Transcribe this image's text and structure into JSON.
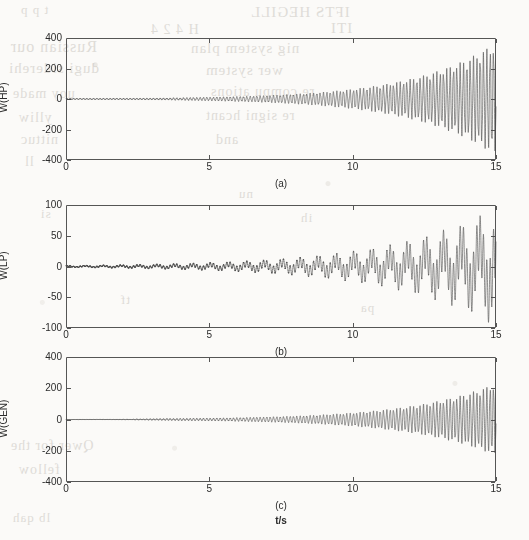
{
  "figure": {
    "background_color": "#fbfaf8",
    "ink_color": "#4a4a4a",
    "axis_color": "#555555",
    "xlabel": "t/s"
  },
  "bleed_through_text": [
    {
      "text": "t p p",
      "x": 20,
      "y": 2,
      "size": 13
    },
    {
      "text": "IFTS HEGILL",
      "x": 250,
      "y": 4,
      "size": 15
    },
    {
      "text": "H 4 2 4",
      "x": 150,
      "y": 22,
      "size": 14
    },
    {
      "text": "ITI",
      "x": 330,
      "y": 20,
      "size": 15
    },
    {
      "text": "Russian our",
      "x": 10,
      "y": 38,
      "size": 16
    },
    {
      "text": "nig system plan",
      "x": 190,
      "y": 40,
      "size": 15
    },
    {
      "text": "dugi siderehi",
      "x": 8,
      "y": 60,
      "size": 15
    },
    {
      "text": "wer system",
      "x": 205,
      "y": 62,
      "size": 15
    },
    {
      "text": "uoy made",
      "x": 12,
      "y": 86,
      "size": 14
    },
    {
      "text": "re compu ations",
      "x": 210,
      "y": 84,
      "size": 14
    },
    {
      "text": "ylliw",
      "x": 18,
      "y": 110,
      "size": 14
    },
    {
      "text": "re signi hcant",
      "x": 205,
      "y": 108,
      "size": 14
    },
    {
      "text": "nittuc",
      "x": 20,
      "y": 132,
      "size": 14
    },
    {
      "text": "and",
      "x": 215,
      "y": 132,
      "size": 14
    },
    {
      "text": "ll",
      "x": 24,
      "y": 154,
      "size": 14
    },
    {
      "text": "nu",
      "x": 238,
      "y": 186,
      "size": 13
    },
    {
      "text": "si",
      "x": 40,
      "y": 206,
      "size": 13
    },
    {
      "text": "ih",
      "x": 300,
      "y": 210,
      "size": 13
    },
    {
      "text": "tf",
      "x": 120,
      "y": 292,
      "size": 13
    },
    {
      "text": "pa",
      "x": 360,
      "y": 300,
      "size": 13
    },
    {
      "text": "Qwer for the",
      "x": 10,
      "y": 438,
      "size": 14
    },
    {
      "text": "fellow",
      "x": 18,
      "y": 462,
      "size": 14
    },
    {
      "text": "lb qah",
      "x": 12,
      "y": 510,
      "size": 13
    }
  ],
  "panels": [
    {
      "id": "panel-a",
      "caption": "(a)",
      "ylabel": "W(HP)",
      "box": {
        "left": 66,
        "top": 38,
        "width": 430,
        "height": 122
      },
      "caption_pos": {
        "x": 281,
        "y": 178
      },
      "chart_data": {
        "type": "line",
        "title": "",
        "xlabel": "",
        "ylabel": "W(HP)",
        "xlim": [
          0,
          15
        ],
        "ylim": [
          -400,
          400
        ],
        "xticks": [
          0,
          5,
          10,
          15
        ],
        "xticklabels": [
          "0",
          "5",
          "10",
          "15"
        ],
        "yticks": [
          -400,
          -200,
          0,
          200,
          400
        ],
        "yticklabels": [
          "-400",
          "-200",
          "0",
          "200",
          "400"
        ],
        "grid": false,
        "legend": null,
        "series": [
          {
            "name": "W(HP)",
            "description": "Exponentially growing torsional oscillation of the high pressure turbine section; unstable sub-synchronous resonance.",
            "model": "damped_growing_sinusoid",
            "envelope_type": "exponential",
            "envelope_start_amplitude": 2.0,
            "envelope_end_amplitude": 372,
            "envelope_growth_rate": 0.352,
            "oscillation_frequency_hz": 8.6,
            "secondary_frequency_hz": 23.5,
            "secondary_amplitude_ratio": 0.17,
            "phase": 0.0,
            "sampled_t": [
              0,
              1,
              2,
              3,
              4,
              5,
              6,
              7,
              8,
              9,
              10,
              11,
              12,
              13,
              14,
              15
            ],
            "sampled_envelope": [
              2,
              2.8,
              4,
              5.7,
              8.2,
              11.6,
              16.5,
              23.5,
              33.4,
              47.5,
              67.6,
              96.2,
              136.8,
              194.6,
              261,
              372
            ]
          }
        ]
      }
    },
    {
      "id": "panel-b",
      "caption": "(b)",
      "ylabel": "W(LP)",
      "box": {
        "left": 66,
        "top": 205,
        "width": 430,
        "height": 123
      },
      "caption_pos": {
        "x": 281,
        "y": 346
      },
      "chart_data": {
        "type": "line",
        "title": "",
        "xlabel": "",
        "ylabel": "W(LP)",
        "xlim": [
          0,
          15
        ],
        "ylim": [
          -100,
          100
        ],
        "xticks": [
          0,
          5,
          10,
          15
        ],
        "xticklabels": [
          "0",
          "5",
          "10",
          "15"
        ],
        "yticks": [
          -100,
          -50,
          0,
          50,
          100
        ],
        "yticklabels": [
          "-100",
          "-50",
          "0",
          "50",
          "100"
        ],
        "grid": false,
        "legend": null,
        "series": [
          {
            "name": "W(LP)",
            "description": "Exponentially growing torsional oscillation of the low pressure turbine section; visible low-frequency ripple from early time.",
            "model": "damped_growing_sinusoid",
            "envelope_type": "exponential",
            "envelope_start_amplitude": 1.6,
            "envelope_end_amplitude": 97,
            "envelope_growth_rate": 0.274,
            "oscillation_frequency_hz": 8.6,
            "secondary_frequency_hz": 1.6,
            "secondary_amplitude_ratio": 0.9,
            "phase": 0.0,
            "sampled_t": [
              0,
              1,
              2,
              3,
              4,
              5,
              6,
              7,
              8,
              9,
              10,
              11,
              12,
              13,
              14,
              15
            ],
            "sampled_envelope": [
              1.6,
              2.1,
              2.8,
              3.6,
              4.7,
              6.2,
              8.1,
              10.6,
              13.9,
              18.2,
              23.8,
              31.2,
              40.9,
              53.6,
              70.2,
              97
            ]
          }
        ]
      }
    },
    {
      "id": "panel-c",
      "caption": "(c)",
      "ylabel": "W(GEN)",
      "box": {
        "left": 66,
        "top": 357,
        "width": 430,
        "height": 125
      },
      "caption_pos": {
        "x": 281,
        "y": 500
      },
      "chart_data": {
        "type": "line",
        "title": "",
        "xlabel": "t/s",
        "ylabel": "W(GEN)",
        "xlim": [
          0,
          15
        ],
        "ylim": [
          -400,
          400
        ],
        "xticks": [
          0,
          5,
          10,
          15
        ],
        "xticklabels": [
          "0",
          "5",
          "10",
          "15"
        ],
        "yticks": [
          -400,
          -200,
          0,
          200,
          400
        ],
        "yticklabels": [
          "-400",
          "-200",
          "0",
          "200",
          "400"
        ],
        "grid": false,
        "legend": null,
        "series": [
          {
            "name": "W(GEN)",
            "description": "Exponentially growing torsional oscillation of the generator rotor; peak amplitude lower than the HP section.",
            "model": "damped_growing_sinusoid",
            "envelope_type": "exponential",
            "envelope_start_amplitude": 1.5,
            "envelope_end_amplitude": 232,
            "envelope_growth_rate": 0.336,
            "oscillation_frequency_hz": 8.6,
            "secondary_frequency_hz": 23.5,
            "secondary_amplitude_ratio": 0.14,
            "phase": 0.0,
            "sampled_t": [
              0,
              1,
              2,
              3,
              4,
              5,
              6,
              7,
              8,
              9,
              10,
              11,
              12,
              13,
              14,
              15
            ],
            "sampled_envelope": [
              1.5,
              2.1,
              2.9,
              4.1,
              5.7,
              8,
              11.2,
              15.6,
              21.9,
              30.6,
              42.8,
              59.9,
              83.8,
              117.3,
              164,
              232
            ]
          }
        ]
      }
    }
  ],
  "xlabel_pos": {
    "x": 281,
    "y": 515
  }
}
